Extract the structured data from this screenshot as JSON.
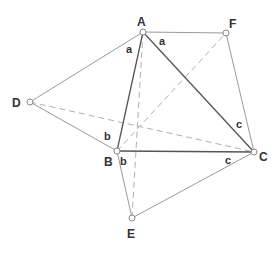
{
  "diagram": {
    "colors": {
      "main_triangle": "#555555",
      "outer_lines": "#9a9a9a",
      "dashed_lines": "#b0b0b0",
      "point_fill": "#ffffff",
      "point_stroke": "#888888",
      "text": "#333333"
    },
    "points": {
      "A": {
        "label": "A",
        "x": 143,
        "y": 32
      },
      "F": {
        "label": "F",
        "x": 226,
        "y": 33
      },
      "D": {
        "label": "D",
        "x": 30,
        "y": 102
      },
      "B": {
        "label": "B",
        "x": 117,
        "y": 151
      },
      "C": {
        "label": "C",
        "x": 254,
        "y": 152
      },
      "E": {
        "label": "E",
        "x": 132,
        "y": 218
      }
    },
    "segment_labels": {
      "a1": "a",
      "a2": "a",
      "b1": "b",
      "b2": "b",
      "c1": "c",
      "c2": "c"
    },
    "main_triangle": [
      "A",
      "B",
      "C"
    ],
    "outer_segments": [
      [
        "A",
        "D"
      ],
      [
        "D",
        "B"
      ],
      [
        "A",
        "F"
      ],
      [
        "F",
        "C"
      ],
      [
        "B",
        "E"
      ],
      [
        "E",
        "C"
      ]
    ],
    "dashed_segments": [
      [
        "A",
        "E"
      ],
      [
        "B",
        "F"
      ],
      [
        "D",
        "C"
      ]
    ]
  }
}
